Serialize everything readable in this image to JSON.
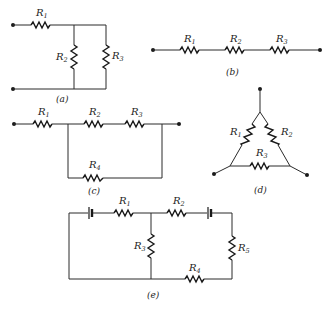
{
  "diagrams": {
    "a": {
      "caption": "(a)",
      "description": "R1 in series with parallel combination of R2 and R3",
      "labels": {
        "r1": "R",
        "r1_sub": "1",
        "r2": "R",
        "r2_sub": "2",
        "r3": "R",
        "r3_sub": "3"
      }
    },
    "b": {
      "caption": "(b)",
      "description": "R1, R2, R3 in series",
      "labels": {
        "r1": "R",
        "r1_sub": "1",
        "r2": "R",
        "r2_sub": "2",
        "r3": "R",
        "r3_sub": "3"
      }
    },
    "c": {
      "caption": "(c)",
      "description": "R1 in series with (R2 + R3) parallel to R4",
      "labels": {
        "r1": "R",
        "r1_sub": "1",
        "r2": "R",
        "r2_sub": "2",
        "r3": "R",
        "r3_sub": "3",
        "r4": "R",
        "r4_sub": "4"
      }
    },
    "d": {
      "caption": "(d)",
      "description": "Delta (triangle) network of R1, R2, R3",
      "labels": {
        "r1": "R",
        "r1_sub": "1",
        "r2": "R",
        "r2_sub": "2",
        "r3": "R",
        "r3_sub": "3"
      }
    },
    "e": {
      "caption": "(e)",
      "description": "Two-loop circuit with two batteries and five resistors",
      "labels": {
        "r1": "R",
        "r1_sub": "1",
        "r2": "R",
        "r2_sub": "2",
        "r3": "R",
        "r3_sub": "3",
        "r4": "R",
        "r4_sub": "4",
        "r5": "R",
        "r5_sub": "5"
      }
    }
  }
}
